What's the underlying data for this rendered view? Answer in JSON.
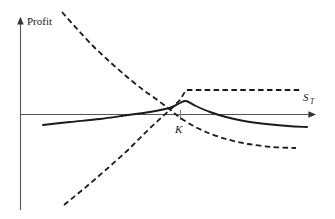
{
  "figure": {
    "background_color": "#ffffff",
    "ink_color": "#1a1a1a",
    "axis_color": "#555555",
    "caption_fragment": "",
    "labels": {
      "y_axis": "Profit",
      "x_axis_base": "S",
      "x_axis_subscript": "T",
      "strike": "K"
    }
  },
  "chart_data": {
    "type": "line",
    "title": "",
    "subtitle": "",
    "xlabel": "S_T",
    "ylabel": "Profit",
    "grid": false,
    "legend": null,
    "annotations": [
      {
        "text": "K",
        "x": 180,
        "y": 128,
        "meaning": "strike-price-marker"
      },
      {
        "text": "Profit",
        "x": 26,
        "y": 23,
        "meaning": "y-axis-label"
      },
      {
        "text": "S_T",
        "x": 305,
        "y": 100,
        "meaning": "x-axis-label"
      }
    ],
    "axes": {
      "origin_px": {
        "x": 20,
        "y": 114
      },
      "x_axis_start_px": 20,
      "x_axis_end_px": 322,
      "y_axis_top_px": 14,
      "y_axis_bottom_px": 210,
      "strike_tick_px": {
        "x": 180,
        "y_top": 110,
        "y_bottom": 120
      }
    },
    "series": [
      {
        "name": "combined-position",
        "style": "solid",
        "color": "#1a1a1a",
        "width": 1.9,
        "points_px": [
          [
            43,
            125
          ],
          [
            70,
            122
          ],
          [
            100,
            119
          ],
          [
            128,
            115
          ],
          [
            150,
            112
          ],
          [
            165,
            109
          ],
          [
            172,
            107
          ],
          [
            180,
            103
          ],
          [
            186,
            101
          ],
          [
            196,
            106
          ],
          [
            210,
            112
          ],
          [
            226,
            117
          ],
          [
            244,
            121
          ],
          [
            266,
            124
          ],
          [
            288,
            126
          ],
          [
            307,
            127
          ]
        ]
      },
      {
        "name": "short-underlying-or-short-call",
        "style": "dashed",
        "color": "#1a1a1a",
        "width": 1.8,
        "points_px": [
          [
            62,
            12
          ],
          [
            78,
            30
          ],
          [
            94,
            47
          ],
          [
            110,
            62
          ],
          [
            126,
            76
          ],
          [
            142,
            89
          ],
          [
            156,
            99
          ],
          [
            168,
            108
          ],
          [
            178,
            116
          ],
          [
            190,
            124
          ],
          [
            206,
            132
          ],
          [
            226,
            139
          ],
          [
            248,
            144
          ],
          [
            272,
            147
          ],
          [
            296,
            148
          ]
        ]
      },
      {
        "name": "long-call-payoff",
        "style": "dashed",
        "color": "#1a1a1a",
        "width": 1.8,
        "points_px": [
          [
            64,
            205
          ],
          [
            86,
            187
          ],
          [
            108,
            168
          ],
          [
            128,
            150
          ],
          [
            148,
            130
          ],
          [
            162,
            117
          ],
          [
            172,
            108
          ],
          [
            180,
            100
          ],
          [
            186,
            90
          ],
          [
            210,
            90
          ],
          [
            240,
            90
          ],
          [
            270,
            90
          ],
          [
            300,
            90
          ]
        ]
      }
    ]
  }
}
